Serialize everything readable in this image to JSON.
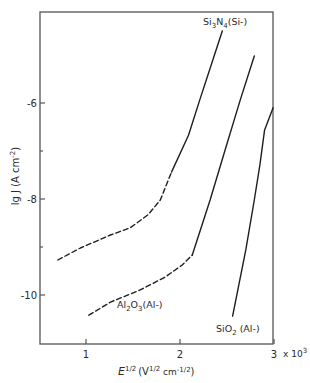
{
  "chart_data": {
    "type": "line",
    "title": "",
    "xlabel": "E^1/2 (V^1/2 cm^-1/2)",
    "xlabel_parts": {
      "main": "E",
      "main_sup": "1/2",
      "unit_open": "(V",
      "unit_sup1": "1/2",
      "unit_mid": " cm",
      "unit_sup2": "-1/2",
      "unit_close": ")"
    },
    "ylabel": "lg J (A cm^-2)",
    "ylabel_text": "lg J (A cm",
    "ylabel_sup": "-2",
    "ylabel_close": ")",
    "x_multiplier_label": "x 10",
    "x_multiplier_exp": "3",
    "xlim": [
      0.5,
      3.0
    ],
    "ylim": [
      -11.0,
      -4.1
    ],
    "xticks": [
      1,
      2,
      3
    ],
    "xtick_labels": [
      "1",
      "2",
      "3"
    ],
    "yticks": [
      -6,
      -8,
      -10
    ],
    "ytick_labels": [
      "-6",
      "-8",
      "-10"
    ],
    "yminor_ticks": [
      -7,
      -9
    ],
    "grid": false,
    "legend": "none (inline labels)",
    "series": [
      {
        "name": "Si3N4(Si-)",
        "label_main": "Si",
        "label_sub1": "3",
        "label_mid": "N",
        "label_sub2": "4",
        "label_tail": "(Si-)",
        "dashed_segment": {
          "x": [
            0.7,
            0.94,
            1.26,
            1.47,
            1.66,
            1.79,
            1.91
          ],
          "y": [
            -9.27,
            -9.02,
            -8.75,
            -8.6,
            -8.33,
            -8.02,
            -7.44
          ]
        },
        "solid_segment": {
          "x": [
            1.91,
            2.09,
            2.21,
            2.35,
            2.45
          ],
          "y": [
            -7.44,
            -6.67,
            -5.94,
            -5.1,
            -4.5
          ]
        }
      },
      {
        "name": "Al2O3(Al-)",
        "label_main": "Al",
        "label_sub1": "2",
        "label_mid": "O",
        "label_sub2": "3",
        "label_tail": "(Al-)",
        "dashed_segment": {
          "x": [
            1.03,
            1.26,
            1.57,
            1.84,
            2.02,
            2.13
          ],
          "y": [
            -10.42,
            -10.15,
            -9.9,
            -9.63,
            -9.38,
            -9.17
          ]
        },
        "solid_segment": {
          "x": [
            2.13,
            2.32,
            2.48,
            2.64,
            2.79
          ],
          "y": [
            -9.17,
            -8.02,
            -6.98,
            -5.94,
            -5.02
          ]
        }
      },
      {
        "name": "SiO2(Al-)",
        "label_main": "SiO",
        "label_sub1": "2",
        "label_tail": " (Al-)",
        "solid_segment": {
          "x": [
            2.56,
            2.7,
            2.79,
            2.85,
            2.9,
            2.99
          ],
          "y": [
            -10.44,
            -9.06,
            -8.02,
            -7.29,
            -6.56,
            -6.1
          ]
        }
      }
    ]
  }
}
